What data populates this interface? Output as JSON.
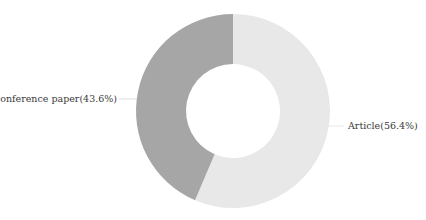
{
  "chart_data": {
    "type": "pie",
    "variant": "donut",
    "title": "",
    "categories": [
      "Article",
      "Conference paper"
    ],
    "values": [
      56.4,
      43.6
    ],
    "labels": [
      "Article(56.4%)",
      "Conference paper(43.6%)"
    ],
    "colors": [
      "#e8e8e8",
      "#a6a6a6"
    ],
    "start_angle": "top, clockwise",
    "legend": "none",
    "label_position": "outside with leader lines"
  },
  "slices": [
    {
      "name": "Article",
      "label": "Article(56.4%)",
      "value": 56.4,
      "color": "#e8e8e8"
    },
    {
      "name": "Conference paper",
      "label": "Conference paper(43.6%)",
      "value": 43.6,
      "color": "#a6a6a6"
    }
  ]
}
